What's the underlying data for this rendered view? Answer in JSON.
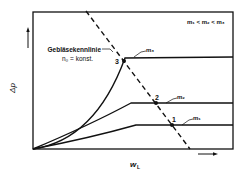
{
  "diagram": {
    "type": "characteristic-curve",
    "condition_label": "m₁ < m₂ < m₃",
    "fan_curve_label_line1": "Gebläsekennlinie",
    "fan_curve_label_line2": "n₀ = konst.",
    "y_axis_label": "Δp",
    "x_axis_label_main": "w",
    "x_axis_label_sub": "L",
    "curves": [
      {
        "name": "m₁",
        "label": "m₁",
        "intersection_label": "1"
      },
      {
        "name": "m₂",
        "label": "m₂",
        "intersection_label": "2"
      },
      {
        "name": "m₃",
        "label": "m₃",
        "intersection_label": "3"
      }
    ],
    "colors": {
      "line": "#111111",
      "background": "#ffffff"
    }
  }
}
